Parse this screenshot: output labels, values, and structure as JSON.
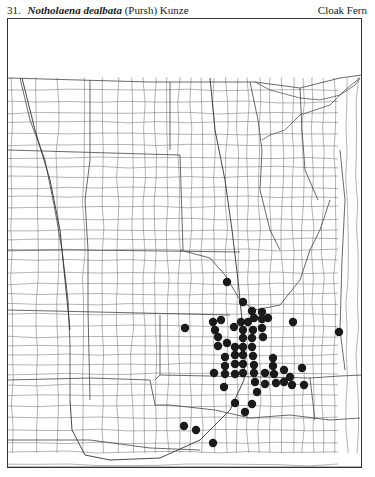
{
  "header": {
    "number": "31.",
    "scientific_name": "Notholaena dealbata",
    "authority": "(Pursh) Kunze",
    "common_name": "Cloak Fern"
  },
  "map": {
    "type": "county dot distribution map",
    "region": "Great Plains (North Dakota to Oklahoma, Montana/Colorado to Minnesota/Missouri/Arkansas)",
    "dot_color": "#1a1a1a",
    "line_color": "#555555",
    "frame": {
      "x": 7,
      "y": 18,
      "width": 355,
      "height": 450
    },
    "occurrences": [
      [
        227,
        282
      ],
      [
        243,
        302
      ],
      [
        252,
        311
      ],
      [
        262,
        312
      ],
      [
        185,
        328
      ],
      [
        213,
        322
      ],
      [
        221,
        320
      ],
      [
        234,
        327
      ],
      [
        241,
        322
      ],
      [
        248,
        322
      ],
      [
        254,
        318
      ],
      [
        262,
        319
      ],
      [
        268,
        318
      ],
      [
        293,
        322
      ],
      [
        339,
        332
      ],
      [
        215,
        330
      ],
      [
        243,
        330
      ],
      [
        253,
        330
      ],
      [
        262,
        328
      ],
      [
        218,
        337
      ],
      [
        243,
        338
      ],
      [
        252,
        338
      ],
      [
        263,
        337
      ],
      [
        227,
        343
      ],
      [
        218,
        346
      ],
      [
        235,
        347
      ],
      [
        243,
        347
      ],
      [
        252,
        347
      ],
      [
        225,
        357
      ],
      [
        235,
        355
      ],
      [
        243,
        355
      ],
      [
        253,
        356
      ],
      [
        273,
        358
      ],
      [
        214,
        373
      ],
      [
        225,
        366
      ],
      [
        235,
        364
      ],
      [
        243,
        364
      ],
      [
        254,
        365
      ],
      [
        273,
        366
      ],
      [
        284,
        370
      ],
      [
        302,
        368
      ],
      [
        225,
        374
      ],
      [
        235,
        374
      ],
      [
        243,
        373
      ],
      [
        254,
        373
      ],
      [
        265,
        373
      ],
      [
        274,
        374
      ],
      [
        255,
        382
      ],
      [
        265,
        384
      ],
      [
        276,
        383
      ],
      [
        284,
        382
      ],
      [
        290,
        377
      ],
      [
        292,
        385
      ],
      [
        304,
        385
      ],
      [
        224,
        387
      ],
      [
        257,
        392
      ],
      [
        235,
        403
      ],
      [
        252,
        404
      ],
      [
        245,
        412
      ],
      [
        184,
        426
      ],
      [
        196,
        430
      ],
      [
        213,
        443
      ]
    ]
  }
}
